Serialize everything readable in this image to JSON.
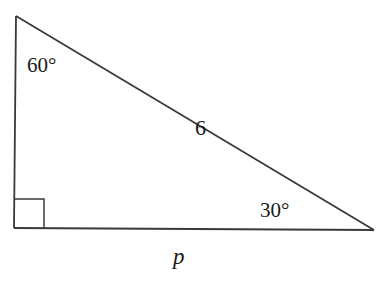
{
  "diagram": {
    "type": "right-triangle",
    "stroke_color": "#3a3a3a",
    "vertices": {
      "top": {
        "x": 16,
        "y": 16
      },
      "right_angle": {
        "x": 14,
        "y": 228
      },
      "bottom_right": {
        "x": 374,
        "y": 230
      }
    },
    "right_angle_marker": {
      "x": 14,
      "y": 199,
      "size": 30
    },
    "labels": {
      "top_angle": "60°",
      "hypotenuse": "6",
      "bottom_right_angle": "30°",
      "base": "p"
    }
  }
}
